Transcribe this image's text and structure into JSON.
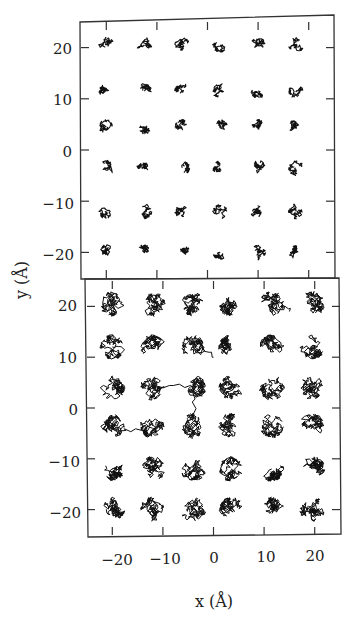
{
  "chart_data": [
    {
      "panel": "top",
      "type": "scatter",
      "description": "Trajectories of 36 particles on a 6x6 lattice; small localized excursions (solid-like state)",
      "xlabel": "x (Å)",
      "ylabel": "y (Å)",
      "xlim": [
        -25,
        25
      ],
      "ylim": [
        -25,
        25
      ],
      "xticks": [
        -20,
        -10,
        0,
        10,
        20
      ],
      "yticks": [
        -20,
        -10,
        0,
        10,
        20
      ],
      "grid": false,
      "lattice_x": [
        -20,
        -12.5,
        -5,
        2.5,
        10,
        17.5
      ],
      "lattice_y": [
        20.5,
        11.5,
        4.5,
        -3.5,
        -12,
        -20
      ],
      "cluster_radius_approx": 1.5
    },
    {
      "panel": "bottom",
      "type": "scatter",
      "description": "Trajectories of 36 particles on a 6x6 lattice; larger excursions with a few long hops (more mobile state)",
      "xlabel": "x (Å)",
      "ylabel": "y (Å)",
      "xlim": [
        -25,
        25
      ],
      "ylim": [
        -25,
        25
      ],
      "xticks": [
        -20,
        -10,
        0,
        10,
        20
      ],
      "yticks": [
        -20,
        -10,
        0,
        10,
        20
      ],
      "grid": false,
      "lattice_x": [
        -20,
        -12,
        -4,
        3.5,
        11.5,
        19.5
      ],
      "lattice_y": [
        20.5,
        12,
        4,
        -3.5,
        -12,
        -20
      ],
      "cluster_radius_approx": 2.5,
      "long_excursions": [
        {
          "from": [
            -12,
            4
          ],
          "to": [
            -4,
            4
          ]
        },
        {
          "from": [
            -4,
            4
          ],
          "to": [
            -4,
            -4
          ]
        },
        {
          "from": [
            -20,
            -4
          ],
          "to": [
            -12,
            -4
          ]
        },
        {
          "from": [
            -4,
            12
          ],
          "to": [
            0,
            10
          ]
        },
        {
          "from": [
            11.5,
            20.5
          ],
          "to": [
            15,
            19
          ]
        }
      ]
    }
  ],
  "axes": {
    "x_label": "x (Å)",
    "y_label": "y (Å)",
    "x_tick_labels": [
      "−20",
      "−10",
      "0",
      "10",
      "20"
    ],
    "top_y_tick_labels": [
      "20",
      "10",
      "0",
      "−10",
      "−20"
    ],
    "bottom_y_tick_labels": [
      "20",
      "10",
      "0",
      "−10",
      "−20"
    ]
  }
}
